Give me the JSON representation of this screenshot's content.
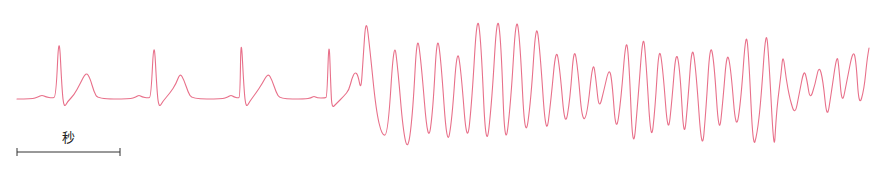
{
  "chart_data": {
    "type": "line",
    "title": "",
    "xlabel": "",
    "ylabel": "",
    "grid": false,
    "legend": null,
    "stroke_color": "#e8708a",
    "scale_bar": {
      "label": "秒",
      "x_start": 17,
      "x_end": 120,
      "y": 152
    },
    "series": [
      {
        "name": "ECG trace",
        "points": [
          [
            17,
            99
          ],
          [
            32,
            99
          ],
          [
            38,
            97
          ],
          [
            42,
            95
          ],
          [
            46,
            97
          ],
          [
            52,
            98
          ],
          [
            56,
            97
          ],
          [
            59,
            30
          ],
          [
            62,
            90
          ],
          [
            64,
            108
          ],
          [
            68,
            101
          ],
          [
            74,
            95
          ],
          [
            80,
            84
          ],
          [
            86,
            72
          ],
          [
            90,
            78
          ],
          [
            94,
            92
          ],
          [
            98,
            99
          ],
          [
            130,
            99
          ],
          [
            136,
            97
          ],
          [
            139,
            95
          ],
          [
            142,
            97
          ],
          [
            148,
            98
          ],
          [
            151,
            97
          ],
          [
            154,
            35
          ],
          [
            157,
            92
          ],
          [
            159,
            108
          ],
          [
            163,
            101
          ],
          [
            170,
            93
          ],
          [
            176,
            84
          ],
          [
            180,
            73
          ],
          [
            184,
            80
          ],
          [
            188,
            92
          ],
          [
            192,
            99
          ],
          [
            222,
            99
          ],
          [
            228,
            97
          ],
          [
            231,
            95
          ],
          [
            234,
            97
          ],
          [
            238,
            98
          ],
          [
            240,
            97
          ],
          [
            241,
            32
          ],
          [
            244,
            90
          ],
          [
            246,
            108
          ],
          [
            250,
            101
          ],
          [
            256,
            93
          ],
          [
            262,
            84
          ],
          [
            268,
            73
          ],
          [
            272,
            80
          ],
          [
            276,
            92
          ],
          [
            280,
            99
          ],
          [
            305,
            99
          ],
          [
            311,
            98
          ],
          [
            314,
            96
          ],
          [
            317,
            98
          ],
          [
            325,
            98
          ],
          [
            327,
            97
          ],
          [
            329,
            34
          ],
          [
            331,
            92
          ],
          [
            332,
            108
          ],
          [
            336,
            104
          ],
          [
            344,
            96
          ],
          [
            349,
            90
          ],
          [
            352,
            78
          ],
          [
            355,
            72
          ],
          [
            358,
            75
          ],
          [
            361,
            91
          ],
          [
            363,
            60
          ],
          [
            366,
            16
          ],
          [
            370,
            50
          ],
          [
            376,
            110
          ],
          [
            382,
            136
          ],
          [
            388,
            134
          ],
          [
            394,
            38
          ],
          [
            398,
            70
          ],
          [
            403,
            130
          ],
          [
            408,
            152
          ],
          [
            413,
            110
          ],
          [
            417,
            33
          ],
          [
            421,
            60
          ],
          [
            428,
            146
          ],
          [
            433,
            110
          ],
          [
            437,
            33
          ],
          [
            441,
            60
          ],
          [
            447,
            148
          ],
          [
            452,
            120
          ],
          [
            457,
            47
          ],
          [
            461,
            70
          ],
          [
            467,
            148
          ],
          [
            472,
            100
          ],
          [
            477,
            13
          ],
          [
            481,
            40
          ],
          [
            486,
            155
          ],
          [
            492,
            100
          ],
          [
            497,
            13
          ],
          [
            501,
            40
          ],
          [
            505,
            153
          ],
          [
            511,
            100
          ],
          [
            516,
            14
          ],
          [
            520,
            40
          ],
          [
            525,
            143
          ],
          [
            531,
            100
          ],
          [
            536,
            20
          ],
          [
            540,
            50
          ],
          [
            546,
            140
          ],
          [
            551,
            100
          ],
          [
            556,
            46
          ],
          [
            560,
            70
          ],
          [
            565,
            129
          ],
          [
            570,
            100
          ],
          [
            574,
            45
          ],
          [
            578,
            70
          ],
          [
            582,
            120
          ],
          [
            587,
            117
          ],
          [
            593,
            59
          ],
          [
            596,
            80
          ],
          [
            599,
            110
          ],
          [
            604,
            90
          ],
          [
            609,
            68
          ],
          [
            612,
            80
          ],
          [
            616,
            135
          ],
          [
            621,
            100
          ],
          [
            626,
            36
          ],
          [
            629,
            60
          ],
          [
            633,
            157
          ],
          [
            638,
            100
          ],
          [
            643,
            31
          ],
          [
            646,
            60
          ],
          [
            651,
            145
          ],
          [
            655,
            110
          ],
          [
            659,
            44
          ],
          [
            663,
            70
          ],
          [
            668,
            137
          ],
          [
            672,
            100
          ],
          [
            676,
            49
          ],
          [
            680,
            70
          ],
          [
            684,
            143
          ],
          [
            688,
            100
          ],
          [
            692,
            43
          ],
          [
            696,
            70
          ],
          [
            702,
            156
          ],
          [
            706,
            110
          ],
          [
            710,
            43
          ],
          [
            714,
            60
          ],
          [
            719,
            138
          ],
          [
            723,
            100
          ],
          [
            727,
            50
          ],
          [
            731,
            70
          ],
          [
            736,
            133
          ],
          [
            741,
            100
          ],
          [
            746,
            28
          ],
          [
            749,
            60
          ],
          [
            753,
            148
          ],
          [
            757,
            135
          ],
          [
            761,
            100
          ],
          [
            766,
            26
          ],
          [
            769,
            60
          ],
          [
            774,
            155
          ],
          [
            776,
            120
          ],
          [
            778,
            98
          ],
          [
            781,
            75
          ],
          [
            783,
            53
          ],
          [
            786,
            78
          ],
          [
            790,
            100
          ],
          [
            795,
            115
          ],
          [
            799,
            95
          ],
          [
            804,
            69
          ],
          [
            807,
            80
          ],
          [
            810,
            100
          ],
          [
            815,
            85
          ],
          [
            819,
            65
          ],
          [
            823,
            80
          ],
          [
            827,
            120
          ],
          [
            831,
            95
          ],
          [
            837,
            53
          ],
          [
            839,
            68
          ],
          [
            842,
            106
          ],
          [
            847,
            80
          ],
          [
            853,
            50
          ],
          [
            856,
            60
          ],
          [
            859,
            107
          ],
          [
            864,
            90
          ],
          [
            867,
            60
          ],
          [
            869,
            48
          ]
        ]
      }
    ]
  }
}
